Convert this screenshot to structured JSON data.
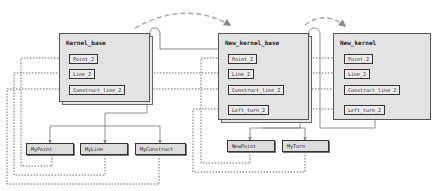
{
  "diagram": {
    "kernels": [
      {
        "title": "Kernel_base",
        "items": [
          "Point_2",
          "Line_2",
          "Construct_line_2"
        ]
      },
      {
        "title": "New_kernel_base",
        "items": [
          "Point_2",
          "Line_2",
          "Construct_line_2",
          "Left_turn_2"
        ]
      },
      {
        "title": "New_kernel",
        "items": [
          "Point_2",
          "Line_2",
          "Construct_line_2",
          "Left_turn_2"
        ]
      }
    ],
    "leaves": [
      {
        "label": "MyPoint"
      },
      {
        "label": "MyLine"
      },
      {
        "label": "MyConstruct"
      },
      {
        "label": "NewPoint"
      },
      {
        "label": "MyTurn"
      }
    ],
    "colors": {
      "box_fill": "#e3e3e3",
      "leaf_fill": "#dcdcdc",
      "border": "#333333",
      "arrow": "#888888",
      "dashed_arc": "#aaaaaa"
    }
  }
}
